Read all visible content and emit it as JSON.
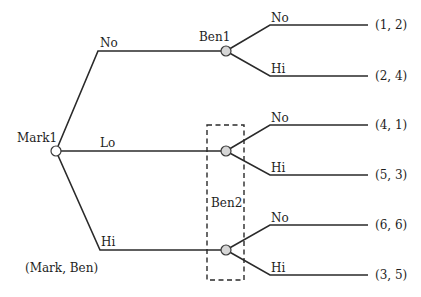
{
  "diagram": {
    "type": "extensive-form game tree",
    "legend": "(Mark, Ben)",
    "root": {
      "label": "Mark1",
      "actions": [
        "No",
        "Lo",
        "Hi"
      ]
    },
    "ben_nodes": {
      "ben1": {
        "label": "Ben1",
        "after": "No"
      },
      "ben2": {
        "label": "Ben2",
        "after": [
          "Lo",
          "Hi"
        ],
        "information_set": true
      }
    },
    "branches": {
      "mark_no": "No",
      "mark_lo": "Lo",
      "mark_hi": "Hi",
      "ben1_no": "No",
      "ben1_hi": "Hi",
      "ben2a_no": "No",
      "ben2a_hi": "Hi",
      "ben2b_no": "No",
      "ben2b_hi": "Hi"
    },
    "payoffs": {
      "p1": "(1, 2)",
      "p2": "(2, 4)",
      "p3": "(4, 1)",
      "p4": "(5, 3)",
      "p5": "(6, 6)",
      "p6": "(3, 5)"
    },
    "colors": {
      "line": "#2a2a2a",
      "node_fill": "#d6d6d6",
      "root_fill": "#ffffff"
    }
  }
}
